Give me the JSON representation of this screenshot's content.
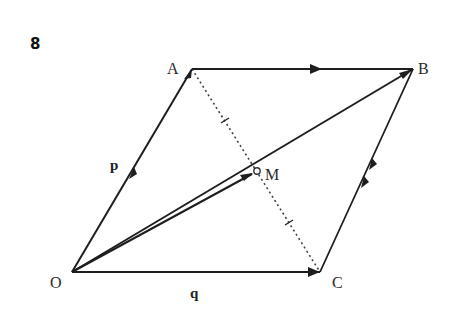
{
  "question_number": "8",
  "points": {
    "O": {
      "label": "O",
      "x": 72,
      "y": 272
    },
    "A": {
      "label": "A",
      "x": 192,
      "y": 69
    },
    "B": {
      "label": "B",
      "x": 413,
      "y": 69
    },
    "C": {
      "label": "C",
      "x": 320,
      "y": 272
    },
    "M": {
      "label": "M",
      "x": 256,
      "y": 171
    }
  },
  "vectors": {
    "p": {
      "label": "p",
      "from": "O",
      "to": "A"
    },
    "q": {
      "label": "q",
      "from": "O",
      "to": "C"
    }
  },
  "segments": [
    {
      "name": "OA",
      "style": "solid",
      "arrows": 2
    },
    {
      "name": "AB",
      "style": "solid",
      "arrows": 1
    },
    {
      "name": "OC",
      "style": "solid",
      "arrows": 1
    },
    {
      "name": "CB",
      "style": "solid",
      "arrows": 2
    },
    {
      "name": "OB",
      "style": "solid",
      "arrows": 1
    },
    {
      "name": "OM",
      "style": "solid",
      "arrows": 1
    },
    {
      "name": "AC",
      "style": "dotted",
      "tick_marks": 2
    }
  ],
  "colors": {
    "line": "#1e1e1e",
    "text": "#2a2a2a",
    "background": "#ffffff"
  }
}
